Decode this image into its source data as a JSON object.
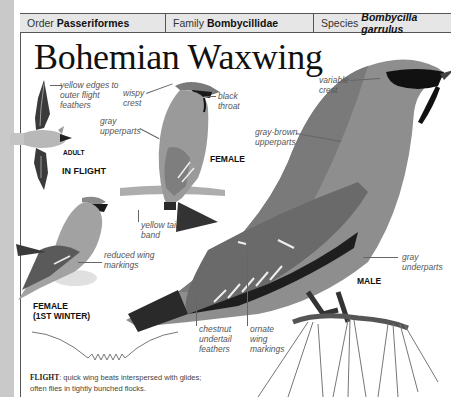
{
  "taxonomy": {
    "order_label": "Order",
    "order_value": "Passeriformes",
    "family_label": "Family",
    "family_value": "Bombycillidae",
    "species_label": "Species",
    "species_value": "Bombycilla garrulus"
  },
  "title": "Bohemian Waxwing",
  "figures": {
    "in_flight": {
      "caption": "IN FLIGHT",
      "sub_caption": "ADULT",
      "annotations": [
        "yellow edges to",
        "outer flight",
        "feathers"
      ]
    },
    "female": {
      "caption": "FEMALE",
      "annotations": {
        "crest": [
          "wispy",
          "crest"
        ],
        "throat": [
          "black",
          "throat"
        ],
        "upperparts": [
          "gray",
          "upperparts"
        ],
        "tail": [
          "yellow tail",
          "band"
        ]
      }
    },
    "female_1st_winter": {
      "caption_line1": "FEMALE",
      "caption_line2": "(1ST WINTER)",
      "annotations": [
        "reduced wing",
        "markings"
      ]
    },
    "male": {
      "caption": "MALE",
      "annotations": {
        "crest": [
          "variable",
          "crest"
        ],
        "upperparts": [
          "gray-brown",
          "upperparts"
        ],
        "underparts": [
          "gray",
          "underparts"
        ],
        "undertail": [
          "chestnut",
          "undertail",
          "feathers"
        ],
        "wing": [
          "ornate",
          "wing",
          "markings"
        ]
      }
    }
  },
  "flight_pattern": {
    "label": "FLIGHT",
    "description_line1": ": quick wing beats interspersed with glides;",
    "description_line2": "often flies in tightly bunched flocks."
  },
  "colors": {
    "page_edge": "#c9c9c9",
    "header_bg": "#e6e6e6",
    "rule": "#555555",
    "label_text": "#555555"
  }
}
